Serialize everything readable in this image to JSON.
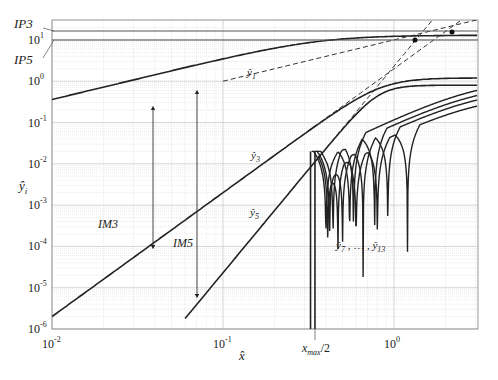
{
  "chart_data": {
    "type": "line",
    "title": "",
    "xlabel": "x̂",
    "ylabel": "ŷi",
    "xscale": "log",
    "yscale": "log",
    "xlim": [
      0.01,
      3.06
    ],
    "ylim": [
      1e-06,
      30
    ],
    "grid": true,
    "x_ticks": [
      "10^-2",
      "10^-1",
      "10^0"
    ],
    "y_ticks": [
      "10^1",
      "10^0",
      "10^-1",
      "10^-2",
      "10^-3",
      "10^-4",
      "10^-5",
      "10^-6"
    ],
    "series": [
      {
        "name": "ŷ1",
        "style": "solid",
        "x": [
          0.01,
          0.05,
          0.2,
          0.5,
          1,
          3.06
        ],
        "values": [
          0.1,
          0.5,
          1.8,
          3.2,
          3.5,
          3.6
        ]
      },
      {
        "name": "ŷ3",
        "style": "solid",
        "x": [
          0.01,
          0.05,
          0.2,
          0.4,
          0.7,
          1,
          3.06
        ],
        "values": [
          2e-06,
          0.00025,
          0.015,
          0.2,
          0.7,
          1.0,
          1.2
        ]
      },
      {
        "name": "ŷ5",
        "style": "solid",
        "x": [
          0.07,
          0.15,
          0.3,
          0.5,
          1,
          3.06
        ],
        "values": [
          1e-06,
          0.00017,
          0.012,
          0.12,
          0.45,
          0.8
        ]
      },
      {
        "name": "ŷ7 … ŷ13",
        "style": "solid",
        "note": "oscillating higher-order products with nulls between x≈0.33 and 1.2, rising toward 0.2–0.6 at right edge"
      },
      {
        "name": "IP3 asymptote",
        "style": "dashed",
        "intercept_y": 15
      },
      {
        "name": "IP5 asymptote",
        "style": "dashed",
        "intercept_y": 20
      }
    ],
    "annotations": [
      "IP3",
      "IP5",
      "IM3",
      "IM5",
      "ŷ1",
      "ŷ3",
      "ŷ5",
      "ŷ7 , … , ŷ13",
      "x_max/2"
    ],
    "reference_levels": {
      "IP3": 20,
      "IP5": 13
    }
  },
  "labels": {
    "ip3": "IP3",
    "ip5": "IP5",
    "im3": "IM3",
    "im5": "IM5",
    "y1": "ŷ",
    "y1_sub": "1",
    "y3": "ŷ",
    "y3_sub": "3",
    "y5": "ŷ",
    "y5_sub": "5",
    "y7_13": "ŷ",
    "y7_sub": "7",
    "y7_mid": " , … , ",
    "y13": "ŷ",
    "y13_sub": "13",
    "xlabel": "x̂",
    "ylabel": "ŷ",
    "ylabel_sub": "i",
    "xmax_main": "x",
    "xmax_sub": "max",
    "xmax_tail": "/2",
    "xtick_base": "10",
    "xtick_exp": [
      "-2",
      "-1",
      "0"
    ],
    "ytick_exp": [
      "1",
      "0",
      "-1",
      "-2",
      "-3",
      "-4",
      "-5",
      "-6"
    ]
  }
}
